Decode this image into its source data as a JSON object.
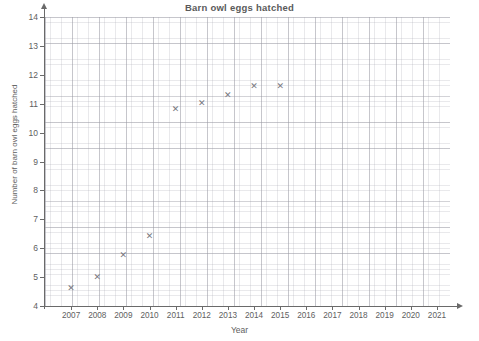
{
  "chart_data": {
    "type": "scatter",
    "title": "Barn owl eggs hatched",
    "xlabel": "Year",
    "ylabel": "Number of barn owl eggs hatched",
    "xlim": [
      2006,
      2021.5
    ],
    "ylim": [
      4,
      14
    ],
    "grid": true,
    "legend": null,
    "marker": "x",
    "marker_color": "#787880",
    "x_ticks": [
      2007,
      2008,
      2009,
      2010,
      2011,
      2012,
      2013,
      2014,
      2015,
      2016,
      2017,
      2018,
      2019,
      2020,
      2021
    ],
    "y_ticks": [
      4,
      5,
      6,
      7,
      8,
      9,
      10,
      11,
      12,
      13,
      14
    ],
    "x": [
      2007,
      2008,
      2009,
      2010,
      2011,
      2012,
      2013,
      2014,
      2015
    ],
    "values": [
      4.6,
      5.0,
      5.75,
      6.4,
      10.8,
      11.0,
      11.3,
      11.6,
      11.6
    ],
    "points": [
      {
        "year": 2007,
        "eggs": 4.6
      },
      {
        "year": 2008,
        "eggs": 5.0
      },
      {
        "year": 2009,
        "eggs": 5.75
      },
      {
        "year": 2010,
        "eggs": 6.4
      },
      {
        "year": 2011,
        "eggs": 10.8
      },
      {
        "year": 2012,
        "eggs": 11.0
      },
      {
        "year": 2013,
        "eggs": 11.3
      },
      {
        "year": 2014,
        "eggs": 11.6
      },
      {
        "year": 2015,
        "eggs": 11.6
      }
    ]
  }
}
